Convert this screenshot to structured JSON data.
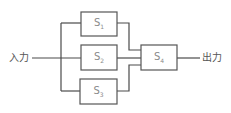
{
  "diagram": {
    "input_label": "入力",
    "output_label": "出力",
    "blocks": [
      {
        "id": "S1",
        "main": "S",
        "sub": "1"
      },
      {
        "id": "S2",
        "main": "S",
        "sub": "2"
      },
      {
        "id": "S3",
        "main": "S",
        "sub": "3"
      },
      {
        "id": "S4",
        "main": "S",
        "sub": "4"
      }
    ],
    "colors": {
      "line": "#4a4a4a",
      "box_border": "#555555",
      "block_text": "#8a8a8a",
      "label_text": "#555555"
    }
  }
}
